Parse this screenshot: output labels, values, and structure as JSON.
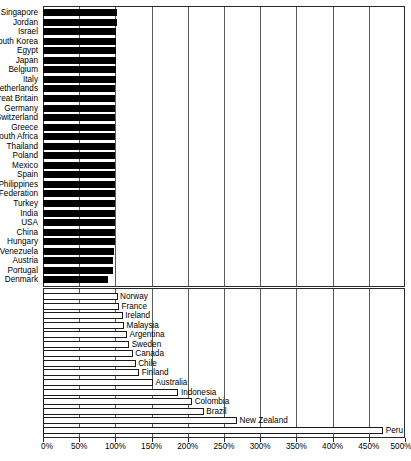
{
  "chart_data": {
    "type": "bar",
    "orientation": "horizontal",
    "title": "",
    "subtitle": "",
    "xlabel": "",
    "ylabel": "",
    "xlim": [
      0,
      500
    ],
    "xunit": "%",
    "grid": true,
    "legend": false,
    "tick_labels": [
      "0%",
      "50%",
      "100%",
      "150%",
      "200%",
      "250%",
      "300%",
      "350%",
      "400%",
      "450%",
      "500%"
    ],
    "tick_values": [
      0,
      50,
      100,
      150,
      200,
      250,
      300,
      350,
      400,
      450,
      500
    ],
    "panels": [
      {
        "name": "below-or-at-100-percent",
        "bar_style": "solid-black",
        "label_position": "left-outside",
        "categories": [
          "Singapore",
          "Jordan",
          "Israel",
          "South Korea",
          "Egypt",
          "Japan",
          "Belgium",
          "Italy",
          "Netherlands",
          "Great Britain",
          "Germany",
          "Switzerland",
          "Greece",
          "South Africa",
          "Thailand",
          "Poland",
          "Mexico",
          "Spain",
          "Philippines",
          "Russian Federation",
          "Turkey",
          "India",
          "USA",
          "China",
          "Hungary",
          "Venezuela",
          "Austria",
          "Portugal",
          "Denmark"
        ],
        "values": [
          102,
          102,
          101,
          101,
          101,
          101,
          101,
          101,
          100,
          100,
          100,
          100,
          100,
          100,
          100,
          100,
          100,
          100,
          100,
          100,
          99,
          99,
          99,
          99,
          99,
          98,
          97,
          97,
          90
        ]
      },
      {
        "name": "above-100-percent",
        "bar_style": "hollow-outline",
        "label_position": "right-outside",
        "categories": [
          "Norway",
          "France",
          "Ireland",
          "Malaysia",
          "Argentina",
          "Sweden",
          "Canada",
          "Chile",
          "Finland",
          "Australia",
          "Indonesia",
          "Colombia",
          "Brazil",
          "New Zealand",
          "Peru"
        ],
        "values": [
          103,
          105,
          110,
          112,
          116,
          119,
          124,
          128,
          133,
          152,
          187,
          206,
          222,
          268,
          470
        ]
      }
    ]
  },
  "axis_caption": ""
}
